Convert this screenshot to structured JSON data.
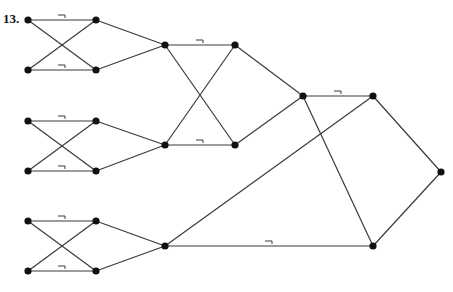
{
  "problem": {
    "number": "13."
  },
  "colors": {
    "edge": "#3a3a3a",
    "node": "#111111",
    "background": "#ffffff"
  },
  "nodes": [
    {
      "id": "a1",
      "x": 28,
      "y": 20
    },
    {
      "id": "b1",
      "x": 96,
      "y": 20
    },
    {
      "id": "a2",
      "x": 28,
      "y": 70
    },
    {
      "id": "b2",
      "x": 96,
      "y": 70
    },
    {
      "id": "a3",
      "x": 28,
      "y": 121
    },
    {
      "id": "b3",
      "x": 96,
      "y": 121
    },
    {
      "id": "a4",
      "x": 28,
      "y": 171
    },
    {
      "id": "b4",
      "x": 96,
      "y": 171
    },
    {
      "id": "a5",
      "x": 28,
      "y": 221
    },
    {
      "id": "b5",
      "x": 96,
      "y": 221
    },
    {
      "id": "a6",
      "x": 28,
      "y": 271
    },
    {
      "id": "b6",
      "x": 96,
      "y": 271
    },
    {
      "id": "c1",
      "x": 165,
      "y": 45
    },
    {
      "id": "d1",
      "x": 235,
      "y": 45
    },
    {
      "id": "c2",
      "x": 165,
      "y": 145
    },
    {
      "id": "d2",
      "x": 235,
      "y": 145
    },
    {
      "id": "c3",
      "x": 165,
      "y": 246
    },
    {
      "id": "e1",
      "x": 303,
      "y": 96
    },
    {
      "id": "f1",
      "x": 373,
      "y": 96
    },
    {
      "id": "f2",
      "x": 373,
      "y": 246
    },
    {
      "id": "g1",
      "x": 441,
      "y": 172
    }
  ],
  "edges": [
    {
      "from": "a1",
      "to": "b1",
      "negated": true
    },
    {
      "from": "a2",
      "to": "b2",
      "negated": true
    },
    {
      "from": "a1",
      "to": "b2",
      "negated": false
    },
    {
      "from": "a2",
      "to": "b1",
      "negated": false
    },
    {
      "from": "a3",
      "to": "b3",
      "negated": true
    },
    {
      "from": "a4",
      "to": "b4",
      "negated": true
    },
    {
      "from": "a3",
      "to": "b4",
      "negated": false
    },
    {
      "from": "a4",
      "to": "b3",
      "negated": false
    },
    {
      "from": "a5",
      "to": "b5",
      "negated": true
    },
    {
      "from": "a6",
      "to": "b6",
      "negated": true
    },
    {
      "from": "a5",
      "to": "b6",
      "negated": false
    },
    {
      "from": "a6",
      "to": "b5",
      "negated": false
    },
    {
      "from": "b1",
      "to": "c1",
      "negated": false
    },
    {
      "from": "b2",
      "to": "c1",
      "negated": false
    },
    {
      "from": "b3",
      "to": "c2",
      "negated": false
    },
    {
      "from": "b4",
      "to": "c2",
      "negated": false
    },
    {
      "from": "b5",
      "to": "c3",
      "negated": false
    },
    {
      "from": "b6",
      "to": "c3",
      "negated": false
    },
    {
      "from": "c1",
      "to": "d1",
      "negated": true
    },
    {
      "from": "c2",
      "to": "d2",
      "negated": true
    },
    {
      "from": "c1",
      "to": "d2",
      "negated": false
    },
    {
      "from": "c2",
      "to": "d1",
      "negated": false
    },
    {
      "from": "d1",
      "to": "e1",
      "negated": false
    },
    {
      "from": "d2",
      "to": "e1",
      "negated": false
    },
    {
      "from": "e1",
      "to": "f1",
      "negated": true
    },
    {
      "from": "e1",
      "to": "f2",
      "negated": false
    },
    {
      "from": "c3",
      "to": "f1",
      "negated": false
    },
    {
      "from": "c3",
      "to": "f2",
      "negated": true
    },
    {
      "from": "f1",
      "to": "g1",
      "negated": false
    },
    {
      "from": "f2",
      "to": "g1",
      "negated": false
    }
  ],
  "negation_symbol": "¬"
}
